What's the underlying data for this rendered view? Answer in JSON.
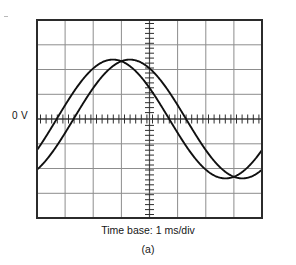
{
  "figure": {
    "panel_label": "(a)",
    "timebase_caption": "Time base: 1 ms/div",
    "zero_reference_label": "0 V"
  },
  "colors": {
    "trace": "#101010",
    "grid_minor": "#8d8d8d",
    "grid_major": "#5a5a5a",
    "border": "#2b2b2b",
    "axis": "#3a3a3a",
    "background": "#ffffff",
    "text": "#141414"
  },
  "chart_data": {
    "type": "line",
    "title": "",
    "subtitle": "",
    "xlabel": "Time base: 1 ms/div",
    "ylabel": "",
    "annotations": [
      {
        "text": "0 V",
        "x": 0,
        "y": 0,
        "position": "left-of-axis"
      },
      {
        "text": "(a)",
        "x": 4,
        "y": -4.6,
        "position": "below-figure"
      }
    ],
    "grid": true,
    "grid_divisions_x": 8,
    "grid_divisions_y": 8,
    "xlim": [
      0,
      8
    ],
    "ylim": [
      -4,
      4
    ],
    "x_unit": "ms",
    "x_per_division": 1,
    "y_zero_division": 4,
    "x_tick_labels": [],
    "y_tick_labels": [],
    "legend": [],
    "legend_position": "none",
    "series": [
      {
        "name": "Channel 1 (leading sine)",
        "amplitude_div": 2.4,
        "period_div": 8,
        "phase_shift_div": 0.7,
        "zero_crossing_rising_div": 0.7,
        "peak_div": 2.7,
        "zero_crossing_falling_div": 4.7,
        "trough_div": 6.7,
        "x": [
          0.0,
          0.25,
          0.5,
          0.75,
          1.0,
          1.25,
          1.5,
          1.75,
          2.0,
          2.25,
          2.5,
          2.75,
          3.0,
          3.25,
          3.5,
          3.75,
          4.0,
          4.25,
          4.5,
          4.75,
          5.0,
          5.25,
          5.5,
          5.75,
          6.0,
          6.25,
          6.5,
          6.75,
          7.0,
          7.25,
          7.5,
          7.75,
          8.0
        ],
        "values": [
          -1.22,
          -0.85,
          -0.45,
          -0.04,
          0.38,
          0.78,
          1.15,
          1.5,
          1.81,
          2.07,
          2.26,
          2.38,
          2.4,
          2.36,
          2.24,
          2.03,
          1.76,
          1.44,
          1.07,
          0.67,
          0.26,
          -0.16,
          -0.57,
          -0.96,
          -1.32,
          -1.65,
          -1.93,
          -2.16,
          -2.31,
          -2.39,
          -2.4,
          -2.33,
          -2.18
        ]
      },
      {
        "name": "Channel 2 (lagging sine)",
        "amplitude_div": 2.4,
        "period_div": 8,
        "phase_shift_div": 1.3,
        "zero_crossing_rising_div": 1.3,
        "peak_div": 3.3,
        "zero_crossing_falling_div": 5.3,
        "trough_div": 7.3,
        "x": [
          0.0,
          0.25,
          0.5,
          0.75,
          1.0,
          1.25,
          1.5,
          1.75,
          2.0,
          2.25,
          2.5,
          2.75,
          3.0,
          3.25,
          3.5,
          3.75,
          4.0,
          4.25,
          4.5,
          4.75,
          5.0,
          5.25,
          5.5,
          5.75,
          6.0,
          6.25,
          6.5,
          6.75,
          7.0,
          7.25,
          7.5,
          7.75,
          8.0
        ],
        "values": [
          -2.18,
          -1.93,
          -1.65,
          -1.32,
          -0.96,
          -0.57,
          -0.16,
          0.26,
          0.67,
          1.07,
          1.44,
          1.76,
          2.03,
          2.24,
          2.36,
          2.4,
          2.38,
          2.26,
          2.07,
          1.81,
          1.5,
          1.15,
          0.78,
          0.38,
          -0.04,
          -0.45,
          -0.85,
          -1.22,
          -1.56,
          -1.86,
          -2.11,
          -2.29,
          -2.39
        ]
      }
    ],
    "phase_difference_div": 0.6,
    "phase_difference_deg": 27
  }
}
